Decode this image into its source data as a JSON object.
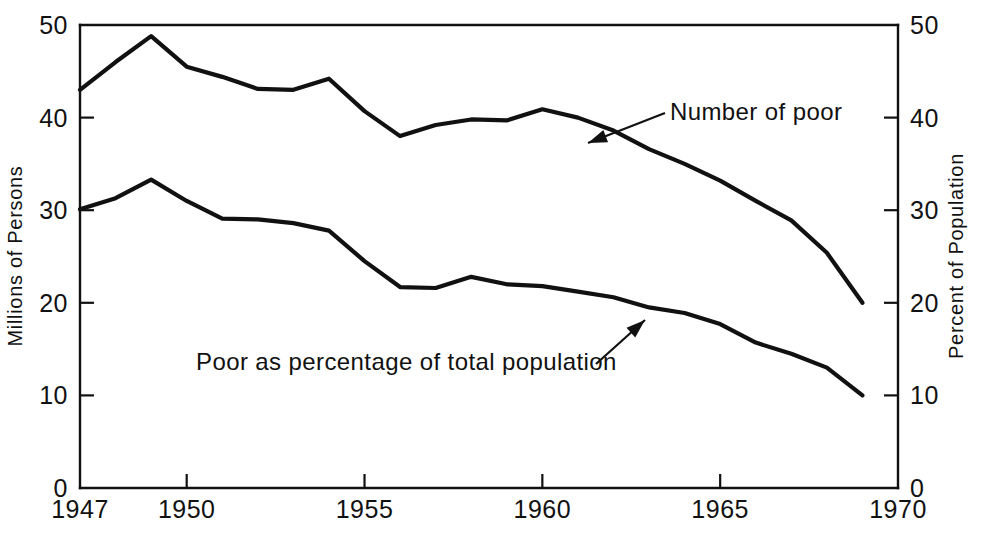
{
  "chart_data": {
    "type": "line",
    "title": "",
    "xlabel": "",
    "ylabel": "Millions of Persons",
    "y2label": "Percent of Population",
    "xlim": [
      1947,
      1970
    ],
    "ylim": [
      0,
      50
    ],
    "y2lim": [
      0,
      50
    ],
    "grid": false,
    "legend_position": "inline-annotations",
    "x_ticks": [
      1947,
      1950,
      1955,
      1960,
      1965,
      1970
    ],
    "x_tick_labels": [
      "1947",
      "1950",
      "1955",
      "1960",
      "1965",
      "1970"
    ],
    "y_ticks": [
      0,
      10,
      20,
      30,
      40,
      50
    ],
    "y_tick_labels": [
      "0",
      "10",
      "20",
      "30",
      "40",
      "50"
    ],
    "y2_ticks": [
      0,
      10,
      20,
      30,
      40,
      50
    ],
    "y2_tick_labels": [
      "0",
      "10",
      "20",
      "30",
      "40",
      "50"
    ],
    "x": [
      1947,
      1948,
      1949,
      1950,
      1951,
      1952,
      1953,
      1954,
      1955,
      1956,
      1957,
      1958,
      1959,
      1960,
      1961,
      1962,
      1963,
      1964,
      1965,
      1966,
      1967,
      1968,
      1969
    ],
    "series": [
      {
        "name": "Number of poor",
        "axis": "left",
        "units": "millions of persons",
        "values": [
          43.0,
          46.0,
          48.8,
          45.5,
          44.4,
          43.1,
          43.0,
          44.2,
          40.7,
          38.0,
          39.2,
          39.8,
          39.7,
          40.9,
          40.0,
          38.6,
          36.6,
          35.0,
          33.2,
          31.0,
          28.9,
          25.4,
          20.0
        ]
      },
      {
        "name": "Poor as percentage of total population",
        "axis": "right",
        "units": "percent of population",
        "values": [
          30.1,
          31.3,
          33.3,
          31.0,
          29.1,
          29.0,
          28.6,
          27.8,
          24.5,
          21.7,
          21.6,
          22.8,
          22.0,
          21.8,
          21.2,
          20.6,
          19.5,
          18.9,
          17.7,
          15.7,
          14.5,
          13.0,
          10.0
        ]
      }
    ],
    "annotations": [
      {
        "id": "number-of-poor",
        "text": "Number of poor",
        "text_x": 670,
        "text_y": 120,
        "anchor": "start",
        "arrow_from_x": 665,
        "arrow_from_y": 113,
        "arrow_to_x": 588,
        "arrow_to_y": 143
      },
      {
        "id": "poor-as-percentage",
        "text": "Poor as percentage of total population",
        "text_x": 196,
        "text_y": 370,
        "anchor": "start",
        "arrow_from_x": 596,
        "arrow_from_y": 364,
        "arrow_to_x": 645,
        "arrow_to_y": 320
      }
    ]
  }
}
